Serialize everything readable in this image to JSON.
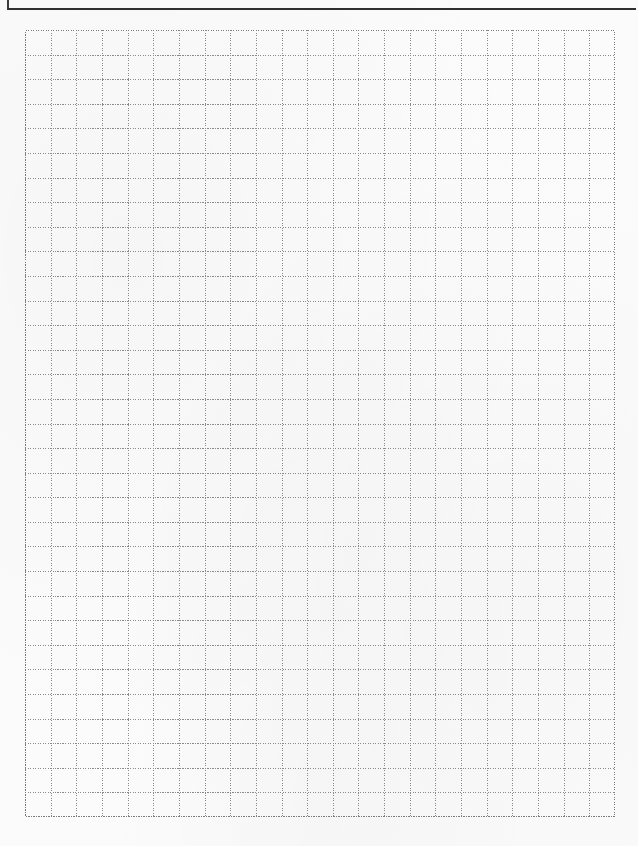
{
  "document": {
    "type": "graph-paper-worksheet",
    "header": {
      "visible_text": ""
    },
    "grid": {
      "columns": 23,
      "rows": 32,
      "line_style": "dotted",
      "line_color": "#8a8a8a",
      "border_color": "#7a7a7a"
    },
    "colors": {
      "paper": "#fbfbfb",
      "header_border": "#2f2f2f",
      "header_remnant": "#c9c9c9"
    }
  }
}
